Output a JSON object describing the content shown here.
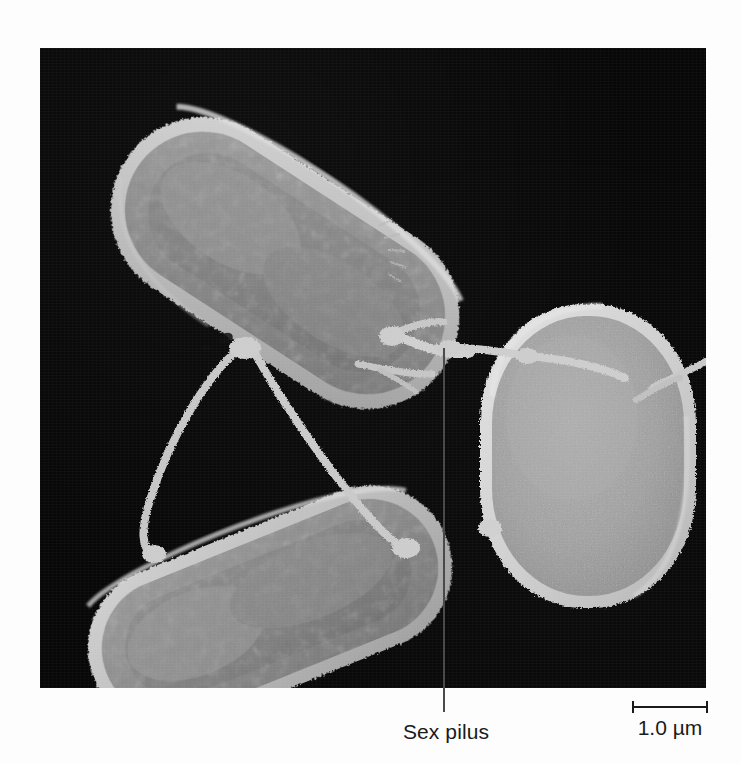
{
  "figure": {
    "type": "scanning-electron-micrograph",
    "background_color": "#ffffff",
    "plate": {
      "background_color": "#070707",
      "left": 40,
      "top": 48,
      "width": 666,
      "height": 640
    }
  },
  "annotations": {
    "sex_pilus": {
      "label": "Sex pilus",
      "leader_line_color": "#4a4a4a",
      "leader_line_top": 348,
      "leader_line_bottom": 712,
      "leader_line_x": 443
    }
  },
  "scale_bar": {
    "label": "1.0 µm",
    "value": 1.0,
    "unit": "µm",
    "bar_color": "#1a1a1a",
    "bar_length_px": 76
  },
  "specimen": {
    "cell_count": 3,
    "cells": [
      {
        "id": "cell-upper-left",
        "shape": "rod",
        "orientation_deg": 33,
        "rim_color": "#c9c9c9",
        "body_color": "#8c8c8c",
        "core_color": "#7c7c7c"
      },
      {
        "id": "cell-lower-left",
        "shape": "rod",
        "orientation_deg": -22,
        "rim_color": "#c6c6c6",
        "body_color": "#8a8a8a",
        "core_color": "#7a7a7a"
      },
      {
        "id": "cell-right",
        "shape": "ovoid",
        "orientation_deg": 0,
        "rim_color": "#d8d8d8",
        "body_color": "#a2a2a2",
        "core_color": "#a2a2a2"
      }
    ],
    "pili": {
      "count": 5,
      "color": "#c8c8c8",
      "description": "Thin filamentous sex pili bridging the three conjugating cells"
    }
  }
}
